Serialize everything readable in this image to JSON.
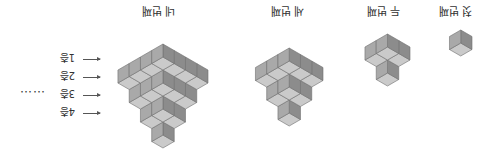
{
  "figures": [
    {
      "id": 1,
      "label": "첫 번째",
      "size": 1
    },
    {
      "id": 2,
      "label": "두 번째",
      "size": 2
    },
    {
      "id": 3,
      "label": "세 번째",
      "size": 3
    },
    {
      "id": 4,
      "label": "네 번째",
      "size": 4
    }
  ],
  "floor_labels": [
    "1층",
    "2층",
    "3층",
    "4층"
  ],
  "ellipsis": "……",
  "colors": {
    "left_face": "#8c8c8c",
    "right_face": "#a9a9a9",
    "top_face": "#cacaca",
    "edge": "#6f6f6f"
  }
}
